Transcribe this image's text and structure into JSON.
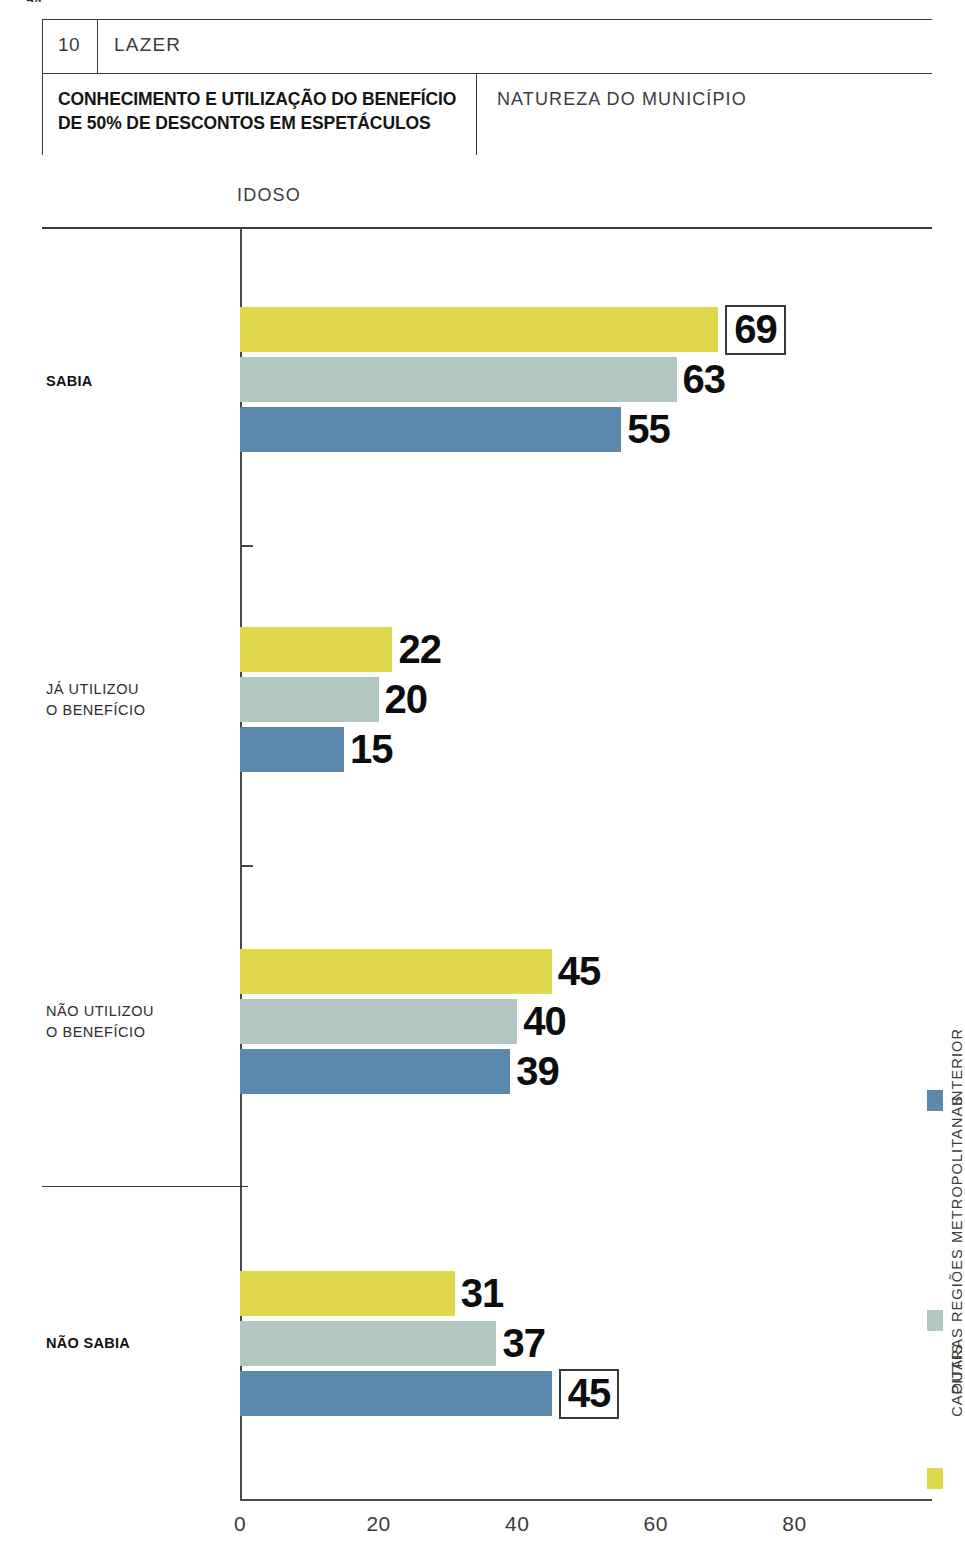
{
  "page": {
    "number_sliver": "54"
  },
  "header": {
    "section_number": "10",
    "section_name": "LAZER",
    "title": "CONHECIMENTO E UTILIZAÇÃO DO BENEFÍCIO DE 50% DE DESCONTOS EM ESPETÁCULOS",
    "breakdown_label": "NATUREZA DO MUNICÍPIO"
  },
  "chart_data": {
    "type": "bar",
    "orientation": "horizontal",
    "title": "CONHECIMENTO E UTILIZAÇÃO DO BENEFÍCIO DE 50% DE DESCONTOS EM ESPETÁCULOS",
    "subtitle": "NATUREZA DO MUNICÍPIO",
    "group_header": "IDOSO",
    "xlabel": "",
    "ylabel": "",
    "xlim": [
      0,
      92
    ],
    "xticks": [
      "0",
      "20",
      "40",
      "60",
      "80"
    ],
    "xtick_values": [
      0,
      20,
      40,
      60,
      80
    ],
    "grid": false,
    "legend_position": "right-vertical",
    "categories": [
      "SABIA",
      "JÁ UTILIZOU\nO BENEFÍCIO",
      "NÃO UTILIZOU\nO BENEFÍCIO",
      "NÃO SABIA"
    ],
    "series": [
      {
        "name": "CAPITAIS",
        "color": "#dfd84c",
        "values": [
          69,
          22,
          45,
          31
        ]
      },
      {
        "name": "OUTRAS REGIÕES METROPOLITANAS",
        "color": "#b2c6c2",
        "values": [
          63,
          20,
          40,
          37
        ]
      },
      {
        "name": "INTERIOR",
        "color": "#5b88ad",
        "values": [
          55,
          15,
          39,
          45
        ]
      }
    ],
    "highlighted_values": [
      {
        "category": "SABIA",
        "series": "CAPITAIS",
        "value": 69
      },
      {
        "category": "NÃO SABIA",
        "series": "INTERIOR",
        "value": 45
      }
    ]
  },
  "groups": [
    {
      "label": "SABIA",
      "bold": true,
      "label_top": 371,
      "bars": [
        {
          "series": "CAPITAIS",
          "value": 69,
          "label": "69",
          "color": "#dfd84c",
          "top": 307,
          "boxed": true
        },
        {
          "series": "OUTRAS REGIÕES METROPOLITANAS",
          "value": 63,
          "label": "63",
          "color": "#b2c6c2",
          "top": 357,
          "boxed": false
        },
        {
          "series": "INTERIOR",
          "value": 55,
          "label": "55",
          "color": "#5b88ad",
          "top": 407,
          "boxed": false
        }
      ]
    },
    {
      "label": "JÁ UTILIZOU\nO BENEFÍCIO",
      "bold": false,
      "label_top": 679,
      "bars": [
        {
          "series": "CAPITAIS",
          "value": 22,
          "label": "22",
          "color": "#dfd84c",
          "top": 627,
          "boxed": false
        },
        {
          "series": "OUTRAS REGIÕES METROPOLITANAS",
          "value": 20,
          "label": "20",
          "color": "#b2c6c2",
          "top": 677,
          "boxed": false
        },
        {
          "series": "INTERIOR",
          "value": 15,
          "label": "15",
          "color": "#5b88ad",
          "top": 727,
          "boxed": false
        }
      ]
    },
    {
      "label": "NÃO UTILIZOU\nO BENEFÍCIO",
      "bold": false,
      "label_top": 1001,
      "bars": [
        {
          "series": "CAPITAIS",
          "value": 45,
          "label": "45",
          "color": "#dfd84c",
          "top": 949,
          "boxed": false
        },
        {
          "series": "OUTRAS REGIÕES METROPOLITANAS",
          "value": 40,
          "label": "40",
          "color": "#b2c6c2",
          "top": 999,
          "boxed": false
        },
        {
          "series": "INTERIOR",
          "value": 39,
          "label": "39",
          "color": "#5b88ad",
          "top": 1049,
          "boxed": false
        }
      ]
    },
    {
      "label": "NÃO SABIA",
      "bold": true,
      "label_top": 1333,
      "bars": [
        {
          "series": "CAPITAIS",
          "value": 31,
          "label": "31",
          "color": "#dfd84c",
          "top": 1271,
          "boxed": false
        },
        {
          "series": "OUTRAS REGIÕES METROPOLITANAS",
          "value": 37,
          "label": "37",
          "color": "#b2c6c2",
          "top": 1321,
          "boxed": false
        },
        {
          "series": "INTERIOR",
          "value": 45,
          "label": "45",
          "color": "#5b88ad",
          "top": 1371,
          "boxed": true
        }
      ]
    }
  ],
  "axis": {
    "ticks": [
      {
        "label": "0",
        "value": 0
      },
      {
        "label": "20",
        "value": 20
      },
      {
        "label": "40",
        "value": 40
      },
      {
        "label": "60",
        "value": 60
      },
      {
        "label": "80",
        "value": 80
      }
    ],
    "group_separators_y": [
      545,
      865
    ],
    "category_divider_y": 1186
  },
  "legend": {
    "items": [
      {
        "label": "INTERIOR",
        "color": "#5b88ad",
        "swatch_top": 1090,
        "text_top": 1028
      },
      {
        "label": "OUTRAS REGIÕES METROPOLITANAS",
        "color": "#b2c6c2",
        "swatch_top": 1310,
        "text_top": 1095
      },
      {
        "label": "CAPITAIS",
        "color": "#dfd84c",
        "swatch_top": 1468,
        "text_top": 1343
      }
    ]
  },
  "scale": {
    "x_origin_px": 240,
    "px_per_unit": 6.93
  }
}
